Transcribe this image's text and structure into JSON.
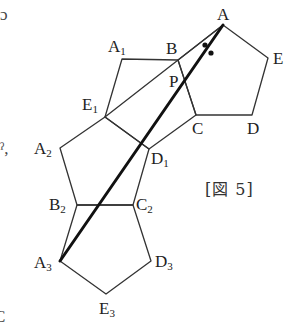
{
  "figure": {
    "caption": "[図 5]",
    "colors": {
      "stroke": "#333333",
      "bold_stroke": "#111111",
      "label": "#222222",
      "background": "#ffffff"
    },
    "vertices": {
      "A": {
        "name": "A",
        "sub": "",
        "x": 223,
        "y": 25
      },
      "B": {
        "name": "B",
        "sub": "",
        "x": 178,
        "y": 60
      },
      "C": {
        "name": "C",
        "sub": "",
        "x": 196,
        "y": 115
      },
      "D": {
        "name": "D",
        "sub": "",
        "x": 252,
        "y": 115
      },
      "E": {
        "name": "E",
        "sub": "",
        "x": 268,
        "y": 58
      },
      "A1": {
        "name": "A",
        "sub": "1",
        "x": 122,
        "y": 59
      },
      "E1": {
        "name": "E",
        "sub": "1",
        "x": 105,
        "y": 117
      },
      "D1": {
        "name": "D",
        "sub": "1",
        "x": 149,
        "y": 149
      },
      "A2": {
        "name": "A",
        "sub": "2",
        "x": 60,
        "y": 148
      },
      "B2": {
        "name": "B",
        "sub": "2",
        "x": 77,
        "y": 205
      },
      "C2": {
        "name": "C",
        "sub": "2",
        "x": 133,
        "y": 205
      },
      "A3": {
        "name": "A",
        "sub": "3",
        "x": 60,
        "y": 261
      },
      "E3": {
        "name": "E",
        "sub": "3",
        "x": 106,
        "y": 294
      },
      "D3": {
        "name": "D",
        "sub": "3",
        "x": 151,
        "y": 261
      },
      "P": {
        "name": "P",
        "sub": "",
        "x": 184,
        "y": 79
      }
    },
    "pentagons": [
      {
        "id": "ABCDE",
        "points": [
          "A",
          "B",
          "C",
          "D",
          "E"
        ]
      },
      {
        "id": "A1BCD1E1",
        "points": [
          "A1",
          "B",
          "C",
          "D1",
          "E1"
        ]
      },
      {
        "id": "A2B2C2D1E1",
        "points": [
          "A2",
          "B2",
          "C2",
          "D1",
          "E1"
        ]
      },
      {
        "id": "A3B2C2D3E3",
        "points": [
          "A3",
          "B2",
          "C2",
          "D3",
          "E3"
        ]
      }
    ],
    "segments": [
      {
        "from": "A",
        "to": "E1",
        "style": "thin"
      },
      {
        "from": "A",
        "to": "A3",
        "style": "bold"
      }
    ],
    "angle_marks": [
      {
        "x": 205,
        "y": 45
      },
      {
        "x": 211,
        "y": 53
      }
    ],
    "labels": [
      {
        "key": "A",
        "text": "A",
        "sub": "",
        "x": 217,
        "y": 6
      },
      {
        "key": "B",
        "text": "B",
        "sub": "",
        "x": 166,
        "y": 40
      },
      {
        "key": "P",
        "text": "P",
        "sub": "",
        "x": 169,
        "y": 73
      },
      {
        "key": "E",
        "text": "E",
        "sub": "",
        "x": 273,
        "y": 50
      },
      {
        "key": "C",
        "text": "C",
        "sub": "",
        "x": 192,
        "y": 120
      },
      {
        "key": "D",
        "text": "D",
        "sub": "",
        "x": 247,
        "y": 120
      },
      {
        "key": "A1",
        "text": "A",
        "sub": "1",
        "x": 108,
        "y": 38
      },
      {
        "key": "E1",
        "text": "E",
        "sub": "1",
        "x": 82,
        "y": 96
      },
      {
        "key": "D1",
        "text": "D",
        "sub": "1",
        "x": 151,
        "y": 150
      },
      {
        "key": "A2",
        "text": "A",
        "sub": "2",
        "x": 34,
        "y": 140
      },
      {
        "key": "B2",
        "text": "B",
        "sub": "2",
        "x": 49,
        "y": 196
      },
      {
        "key": "C2",
        "text": "C",
        "sub": "2",
        "x": 136,
        "y": 196
      },
      {
        "key": "A3",
        "text": "A",
        "sub": "3",
        "x": 34,
        "y": 254
      },
      {
        "key": "D3",
        "text": "D",
        "sub": "3",
        "x": 155,
        "y": 253
      },
      {
        "key": "E3",
        "text": "E",
        "sub": "3",
        "x": 99,
        "y": 300
      }
    ]
  },
  "margin_fragments": [
    {
      "text": "ɔ",
      "x": 0,
      "y": 6
    },
    {
      "text": "ˀ,",
      "x": 0,
      "y": 140
    },
    {
      "text": "C",
      "x": -6,
      "y": 308
    }
  ]
}
